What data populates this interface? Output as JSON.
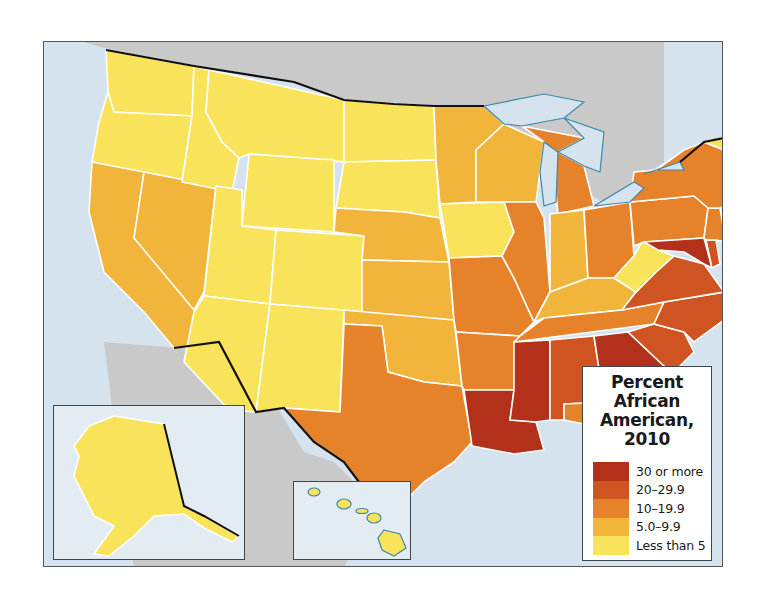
{
  "map": {
    "title": "Percent African American, 2010",
    "legend": {
      "title_lines": [
        "Percent",
        "African",
        "American,",
        "2010"
      ],
      "classes": [
        {
          "label": "30 or more",
          "color": "#b3311a"
        },
        {
          "label": "20–29.9",
          "color": "#cf5421"
        },
        {
          "label": "10–19.9",
          "color": "#e6822a"
        },
        {
          "label": "5.0–9.9",
          "color": "#f2b53c"
        },
        {
          "label": "Less than 5",
          "color": "#f9e35a"
        }
      ]
    },
    "colors": {
      "water": "#d5e3ee",
      "foreign_land": "#c9c9c9",
      "state_border": "#ffffff",
      "coast_outline": "#3f86a8",
      "national_border": "#111111"
    },
    "states": {
      "WA": "Less than 5",
      "OR": "Less than 5",
      "ID": "Less than 5",
      "MT": "Less than 5",
      "WY": "Less than 5",
      "UT": "Less than 5",
      "CO": "Less than 5",
      "AZ": "Less than 5",
      "NM": "Less than 5",
      "ND": "Less than 5",
      "SD": "Less than 5",
      "IA": "Less than 5",
      "WV": "Less than 5",
      "ME": "Less than 5",
      "NH": "Less than 5",
      "VT": "Less than 5",
      "AK": "Less than 5",
      "HI": "Less than 5",
      "CA": "5.0–9.9",
      "NV": "5.0–9.9",
      "NE": "5.0–9.9",
      "KS": "5.0–9.9",
      "OK": "5.0–9.9",
      "MN": "5.0–9.9",
      "WI": "5.0–9.9",
      "IN": "5.0–9.9",
      "KY": "5.0–9.9",
      "MA": "5.0–9.9",
      "RI": "5.0–9.9",
      "TX": "10–19.9",
      "MO": "10–19.9",
      "AR": "10–19.9",
      "IL": "10–19.9",
      "MI": "10–19.9",
      "OH": "10–19.9",
      "TN": "10–19.9",
      "PA": "10–19.9",
      "NY": "10–19.9",
      "NJ": "10–19.9",
      "CT": "10–19.9",
      "FL": "10–19.9",
      "AL": "20–29.9",
      "SC": "20–29.9",
      "NC": "20–29.9",
      "VA": "20–29.9",
      "DE": "20–29.9",
      "LA": "30 or more",
      "MS": "30 or more",
      "GA": "30 or more",
      "MD": "30 or more"
    },
    "insets": [
      "Alaska",
      "Hawaii"
    ]
  }
}
